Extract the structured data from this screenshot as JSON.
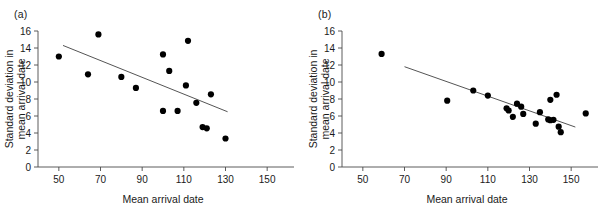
{
  "figure": {
    "panels": [
      {
        "label": "(a)",
        "xlabel": "Mean arrival date",
        "ylabel_line1": "Standard deviation in",
        "ylabel_line2": "mean arrival date",
        "xticks": [
          50,
          70,
          90,
          110,
          130,
          150
        ],
        "yticks": [
          0,
          2,
          4,
          6,
          8,
          10,
          12,
          14,
          16
        ],
        "xlim": [
          40,
          160
        ],
        "ylim": [
          0,
          16
        ],
        "fit_line": {
          "x1": 52,
          "y1": 14.3,
          "x2": 131,
          "y2": 6.5
        },
        "points": [
          {
            "x": 50,
            "y": 13.0
          },
          {
            "x": 64,
            "y": 10.9
          },
          {
            "x": 69,
            "y": 15.6
          },
          {
            "x": 80,
            "y": 10.6
          },
          {
            "x": 87,
            "y": 9.3
          },
          {
            "x": 100,
            "y": 13.25
          },
          {
            "x": 100,
            "y": 6.6
          },
          {
            "x": 103,
            "y": 11.3
          },
          {
            "x": 107,
            "y": 6.6
          },
          {
            "x": 111,
            "y": 9.6
          },
          {
            "x": 112,
            "y": 14.85
          },
          {
            "x": 116,
            "y": 7.55
          },
          {
            "x": 119,
            "y": 4.7
          },
          {
            "x": 121,
            "y": 4.55
          },
          {
            "x": 123,
            "y": 8.55
          },
          {
            "x": 130,
            "y": 3.35
          }
        ]
      },
      {
        "label": "(b)",
        "xlabel": "Mean arrival date",
        "ylabel_line1": "Standard deviation in",
        "ylabel_line2": "mean arrival date",
        "xticks": [
          50,
          70,
          90,
          110,
          130,
          150
        ],
        "yticks": [
          0,
          2,
          4,
          6,
          8,
          10,
          12,
          14,
          16
        ],
        "xlim": [
          40,
          160
        ],
        "ylim": [
          0,
          16
        ],
        "fit_line": {
          "x1": 70,
          "y1": 11.8,
          "x2": 152,
          "y2": 4.7
        },
        "points": [
          {
            "x": 59,
            "y": 13.3
          },
          {
            "x": 90.5,
            "y": 7.8
          },
          {
            "x": 103,
            "y": 9.0
          },
          {
            "x": 110,
            "y": 8.4
          },
          {
            "x": 119,
            "y": 6.9
          },
          {
            "x": 120,
            "y": 6.65
          },
          {
            "x": 122,
            "y": 5.9
          },
          {
            "x": 124,
            "y": 7.45
          },
          {
            "x": 126,
            "y": 7.1
          },
          {
            "x": 127,
            "y": 6.25
          },
          {
            "x": 133,
            "y": 5.1
          },
          {
            "x": 135,
            "y": 6.45
          },
          {
            "x": 139,
            "y": 5.6
          },
          {
            "x": 140,
            "y": 5.5
          },
          {
            "x": 140,
            "y": 7.9
          },
          {
            "x": 141.5,
            "y": 5.55
          },
          {
            "x": 143,
            "y": 8.5
          },
          {
            "x": 144,
            "y": 4.75
          },
          {
            "x": 145,
            "y": 4.1
          },
          {
            "x": 157,
            "y": 6.3
          }
        ]
      }
    ]
  },
  "geometry": {
    "plot_left": 38,
    "plot_right": 288,
    "plot_top": 31,
    "plot_bottom": 167,
    "point_radius": 3.1
  }
}
